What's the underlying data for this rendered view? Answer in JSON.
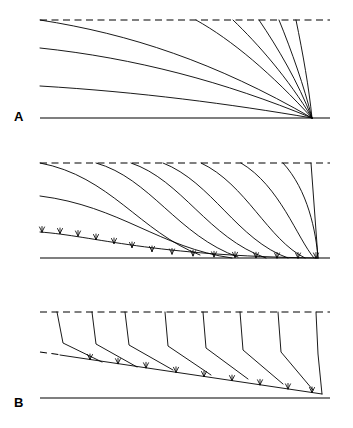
{
  "figure": {
    "background_color": "#ffffff",
    "line_color": "#000000",
    "width": 353,
    "height": 428,
    "panel_count": 3
  },
  "panels": [
    {
      "id": "A",
      "label": "A",
      "label_x": 18,
      "label_y": 118,
      "description": "Radial fan of curved trajectories converging to a single point at lower right",
      "top_boundary": {
        "style": "dashed",
        "x1": 40,
        "y1": 20,
        "x2": 330,
        "y2": 20
      },
      "bottom_boundary": {
        "style": "solid",
        "x1": 40,
        "y1": 118,
        "x2": 330,
        "y2": 118
      },
      "convergence_point": {
        "x": 312,
        "y": 118
      },
      "curve_count": 9,
      "left_origins_y": [
        20,
        48,
        86,
        118
      ],
      "top_origins_x": [
        40,
        195,
        232,
        258,
        277,
        292,
        304
      ],
      "curves": [
        {
          "name": "curve-1",
          "start": [
            40,
            20
          ],
          "c1": [
            130,
            34
          ],
          "c2": [
            215,
            62
          ],
          "end": [
            312,
            118
          ]
        },
        {
          "name": "curve-2",
          "start": [
            40,
            48
          ],
          "c1": [
            135,
            58
          ],
          "c2": [
            225,
            82
          ],
          "end": [
            312,
            118
          ]
        },
        {
          "name": "curve-3",
          "start": [
            40,
            86
          ],
          "c1": [
            140,
            92
          ],
          "c2": [
            230,
            104
          ],
          "end": [
            312,
            118
          ]
        },
        {
          "name": "curve-4",
          "start": [
            40,
            118
          ],
          "c1": [
            150,
            118
          ],
          "c2": [
            240,
            118
          ],
          "end": [
            312,
            118
          ]
        },
        {
          "name": "curve-5",
          "start": [
            196,
            20
          ],
          "c1": [
            232,
            40
          ],
          "c2": [
            272,
            74
          ],
          "end": [
            312,
            118
          ]
        },
        {
          "name": "curve-6",
          "start": [
            233,
            20
          ],
          "c1": [
            258,
            44
          ],
          "c2": [
            288,
            78
          ],
          "end": [
            312,
            118
          ]
        },
        {
          "name": "curve-7",
          "start": [
            259,
            20
          ],
          "c1": [
            278,
            48
          ],
          "c2": [
            298,
            82
          ],
          "end": [
            312,
            118
          ]
        },
        {
          "name": "curve-8",
          "start": [
            279,
            20
          ],
          "c1": [
            292,
            52
          ],
          "c2": [
            304,
            86
          ],
          "end": [
            312,
            118
          ]
        },
        {
          "name": "curve-9",
          "start": [
            296,
            20
          ],
          "c1": [
            303,
            54
          ],
          "c2": [
            309,
            88
          ],
          "end": [
            312,
            118
          ]
        }
      ]
    },
    {
      "id": "B",
      "label": "B",
      "label_x": 18,
      "label_y": 261,
      "description": "Sigmoidal S-shaped trajectories rooting into a hatched basal detachment surface",
      "top_boundary": {
        "style": "dashed",
        "x1": 40,
        "y1": 163,
        "x2": 330,
        "y2": 163
      },
      "bottom_boundary": {
        "style": "solid",
        "x1": 40,
        "y1": 258,
        "x2": 330,
        "y2": 258
      },
      "convergence_point": {
        "x": 318,
        "y": 258
      },
      "curve_count": 9,
      "left_origins_y": [
        163,
        196,
        232
      ],
      "top_origins_x": [
        40,
        96,
        131,
        163,
        201,
        241,
        283,
        310
      ],
      "hatch_marks_count": 16,
      "hatch_side": "upper",
      "curves": [
        {
          "name": "curve-1",
          "start": [
            40,
            163
          ],
          "c1": [
            110,
            176
          ],
          "c2": [
            140,
            232
          ],
          "end": [
            200,
            255
          ]
        },
        {
          "name": "curve-2",
          "start": [
            40,
            196
          ],
          "c1": [
            120,
            206
          ],
          "c2": [
            160,
            248
          ],
          "end": [
            232,
            258
          ]
        },
        {
          "name": "curve-3",
          "start": [
            96,
            163
          ],
          "c1": [
            150,
            178
          ],
          "c2": [
            178,
            236
          ],
          "end": [
            238,
            257
          ]
        },
        {
          "name": "curve-4",
          "start": [
            131,
            163
          ],
          "c1": [
            182,
            180
          ],
          "c2": [
            208,
            238
          ],
          "end": [
            266,
            258
          ]
        },
        {
          "name": "curve-5",
          "start": [
            163,
            163
          ],
          "c1": [
            212,
            182
          ],
          "c2": [
            237,
            240
          ],
          "end": [
            288,
            258
          ]
        },
        {
          "name": "curve-6",
          "start": [
            201,
            163
          ],
          "c1": [
            246,
            184
          ],
          "c2": [
            268,
            240
          ],
          "end": [
            305,
            258
          ]
        },
        {
          "name": "curve-7",
          "start": [
            241,
            163
          ],
          "c1": [
            280,
            186
          ],
          "c2": [
            297,
            238
          ],
          "end": [
            314,
            258
          ]
        },
        {
          "name": "curve-8",
          "start": [
            283,
            163
          ],
          "c1": [
            308,
            190
          ],
          "c2": [
            316,
            232
          ],
          "end": [
            318,
            258
          ]
        },
        {
          "name": "curve-9",
          "start": [
            311,
            163
          ],
          "c1": [
            316,
            196
          ],
          "c2": [
            318,
            230
          ],
          "end": [
            318,
            258
          ]
        }
      ],
      "hatched_curve": {
        "name": "basal-detachment",
        "start": [
          40,
          232
        ],
        "c1": [
          95,
          236
        ],
        "c2": [
          150,
          256
        ],
        "end": [
          318,
          258
        ]
      }
    },
    {
      "id": "C",
      "label": "C",
      "label_x": 20,
      "label_y": 405,
      "description": "Near-vertical segments bending into an inclined hatched basal thrust surface",
      "top_boundary": {
        "style": "dashed",
        "x1": 40,
        "y1": 312,
        "x2": 330,
        "y2": 312
      },
      "bottom_boundary": {
        "style": "solid",
        "x1": 40,
        "y1": 398,
        "x2": 330,
        "y2": 398
      },
      "basal_surface": {
        "style": "solid-hatched",
        "x1": 60,
        "y1": 355,
        "x2": 320,
        "y2": 394
      },
      "basal_surface_dashed_extension": {
        "x1": 40,
        "y1": 352,
        "x2": 62,
        "y2": 355
      },
      "segment_count": 8,
      "top_origins_x": [
        57,
        92,
        125,
        165,
        203,
        240,
        278,
        316
      ],
      "hatch_marks_count": 9,
      "hatch_side": "upper",
      "segments": [
        {
          "name": "segment-1",
          "top": [
            57,
            312
          ],
          "bend": [
            63,
            343
          ],
          "foot": [
            102,
            362
          ]
        },
        {
          "name": "segment-2",
          "top": [
            92,
            312
          ],
          "bend": [
            96,
            344
          ],
          "foot": [
            137,
            367
          ]
        },
        {
          "name": "segment-3",
          "top": [
            125,
            312
          ],
          "bend": [
            129,
            345
          ],
          "foot": [
            173,
            370
          ]
        },
        {
          "name": "segment-4",
          "top": [
            165,
            312
          ],
          "bend": [
            168,
            346
          ],
          "foot": [
            211,
            375
          ]
        },
        {
          "name": "segment-5",
          "top": [
            203,
            312
          ],
          "bend": [
            206,
            348
          ],
          "foot": [
            248,
            379
          ]
        },
        {
          "name": "segment-6",
          "top": [
            240,
            312
          ],
          "bend": [
            243,
            350
          ],
          "foot": [
            283,
            384
          ]
        },
        {
          "name": "segment-7",
          "top": [
            278,
            312
          ],
          "bend": [
            281,
            352
          ],
          "foot": [
            313,
            390
          ]
        },
        {
          "name": "segment-8",
          "top": [
            316,
            312
          ],
          "bend": [
            318,
            354
          ],
          "foot": [
            322,
            394
          ]
        }
      ]
    }
  ]
}
